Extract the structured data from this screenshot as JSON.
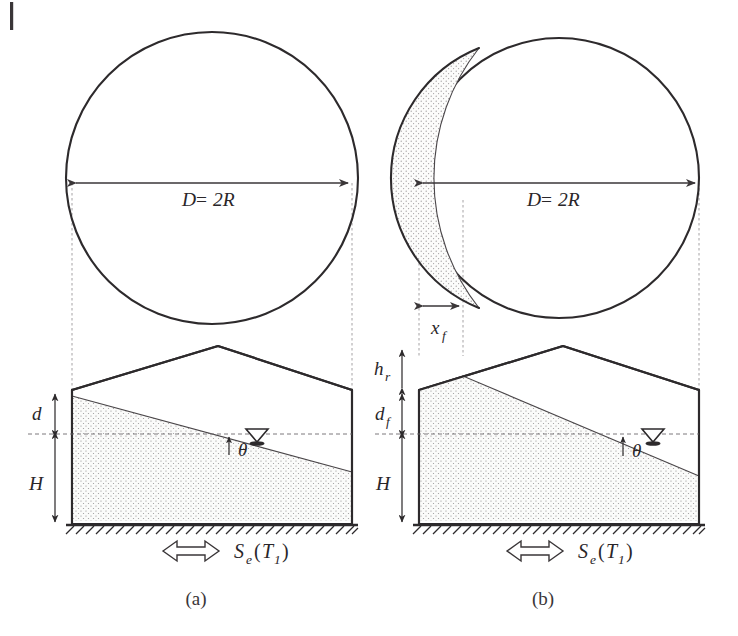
{
  "figure": {
    "kind": "engineering-cross-section-diagram",
    "subfigures": [
      {
        "id": "a",
        "caption": "(a)",
        "plan_view": {
          "shape": "circle",
          "diameter_label": "D = 2R",
          "shaded_region": null
        },
        "section_view": {
          "dimension_labels": [
            "d",
            "H"
          ],
          "angle_label": "θ",
          "base_label": "Sₑ(T₁)",
          "base_label_parts": {
            "main": "S",
            "sub1": "e",
            "open": "(",
            "arg": "T",
            "sub2": "1",
            "close": ")"
          },
          "water_table_symbol": "water-table-triangle",
          "ground_hatching": true
        }
      },
      {
        "id": "b",
        "caption": "(b)",
        "plan_view": {
          "shape": "circle",
          "diameter_label": "D = 2R",
          "shaded_region": "crescent-lens-left",
          "horizontal_dimension_label": "x_f",
          "horizontal_dimension_parts": {
            "main": "x",
            "sub": "f"
          }
        },
        "section_view": {
          "dimension_labels": [
            "h_r",
            "d_f",
            "H"
          ],
          "dimension_label_parts": [
            {
              "main": "h",
              "sub": "r"
            },
            {
              "main": "d",
              "sub": "f"
            },
            {
              "main": "H",
              "sub": ""
            }
          ],
          "angle_label": "θ",
          "base_label": "Sₑ(T₁)",
          "base_label_parts": {
            "main": "S",
            "sub1": "e",
            "open": "(",
            "arg": "T",
            "sub2": "1",
            "close": ")"
          },
          "water_table_symbol": "water-table-triangle",
          "ground_hatching": true
        }
      }
    ],
    "labels": {
      "diameter_D": "D",
      "equals": "=",
      "two_R": "2R",
      "d": "d",
      "H": "H",
      "theta": "θ",
      "h": "h",
      "r_sub": "r",
      "d_main": "d",
      "f_sub": "f",
      "x_main": "x",
      "x_f_sub": "f",
      "S_main": "S",
      "e_sub": "e",
      "paren_open": "(",
      "T_main": "T",
      "one_sub": "1",
      "paren_close": ")",
      "caption_a": "(a)",
      "caption_b": "(b)"
    },
    "colors": {
      "ink": "#2d2a2c",
      "thin_ink": "#4a4649",
      "guide": "#9b979a",
      "fill_stipple": "#e9e8e6",
      "background": "#ffffff"
    }
  }
}
